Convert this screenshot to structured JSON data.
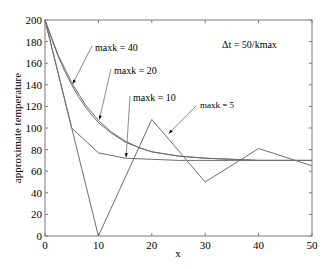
{
  "chart_data": {
    "type": "line",
    "title": "",
    "xlabel": "x",
    "ylabel": "approximate temperature",
    "xlim": [
      0,
      50
    ],
    "ylim": [
      0,
      200
    ],
    "xticks": [
      0,
      10,
      20,
      30,
      40,
      50
    ],
    "yticks": [
      0,
      20,
      40,
      60,
      80,
      100,
      120,
      140,
      160,
      180,
      200
    ],
    "grid": false,
    "legend": "none (inline annotations with arrows)",
    "series": [
      {
        "name": "maxk = 40",
        "x": [
          0,
          1.25,
          2.5,
          3.75,
          5,
          6.25,
          7.5,
          8.75,
          10,
          12.5,
          15,
          17.5,
          20,
          25,
          30,
          35,
          40,
          45,
          50
        ],
        "values": [
          200,
          182,
          166,
          152,
          140,
          129,
          120,
          112,
          105,
          95,
          87,
          82,
          78,
          74,
          72,
          71,
          70,
          70,
          70
        ]
      },
      {
        "name": "maxk = 20",
        "x": [
          0,
          2.5,
          5,
          7.5,
          10,
          12.5,
          15,
          17.5,
          20,
          25,
          30,
          35,
          40,
          45,
          50
        ],
        "values": [
          200,
          167,
          142,
          122,
          107,
          96,
          88,
          82,
          78,
          74,
          72,
          71,
          70,
          70,
          70
        ]
      },
      {
        "name": "maxk = 10",
        "x": [
          0,
          5,
          10,
          15,
          20,
          25,
          30,
          35,
          40,
          45,
          50
        ],
        "values": [
          200,
          100,
          77,
          72,
          71,
          70,
          70,
          70,
          70,
          70,
          70
        ]
      },
      {
        "name": "maxk = 5",
        "x": [
          0,
          10,
          20,
          30,
          40,
          50
        ],
        "values": [
          200,
          0,
          108,
          50,
          81,
          65
        ]
      }
    ],
    "annotations": [
      {
        "text": "maxk = 40",
        "arrow_to": [
          5,
          140
        ]
      },
      {
        "text": "maxk = 20",
        "arrow_to": [
          10,
          107
        ]
      },
      {
        "text": "maxk = 10",
        "arrow_to": [
          15,
          72
        ]
      },
      {
        "text": "maxk = 5",
        "arrow_to": [
          23,
          94
        ]
      },
      {
        "text": "Δt = 50/kmax"
      }
    ]
  },
  "labels": {
    "xlabel": "x",
    "ylabel": "approximate temperature",
    "annot_40": "maxk = 40",
    "annot_20": "maxk = 20",
    "annot_10": "maxk = 10",
    "annot_5": "maxk = 5",
    "annot_dt": "Δt = 50/kmax"
  },
  "colors": {
    "lines": "#6e6e6e",
    "axes": "#7a7a7a",
    "text": "#000000"
  }
}
